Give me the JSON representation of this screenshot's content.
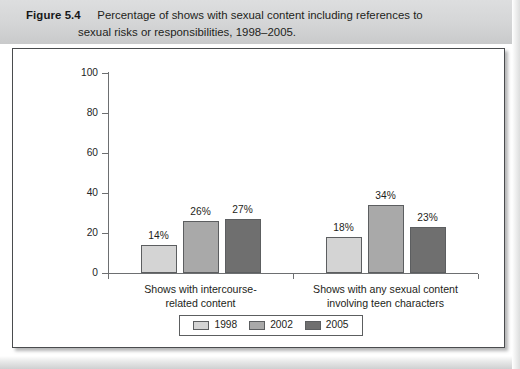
{
  "caption": {
    "figure_label": "Figure 5.4",
    "line1": "Percentage of shows with sexual content including references to",
    "line2": "sexual risks or responsibilities, 1998–2005."
  },
  "chart_data": {
    "type": "bar",
    "title": "Percentage of shows with sexual content including references to sexual risks or responsibilities, 1998–2005.",
    "xlabel": "",
    "ylabel": "",
    "ylim": [
      0,
      100
    ],
    "yticks": [
      "0",
      "20",
      "40",
      "60",
      "80",
      "100"
    ],
    "grid": false,
    "legend_position": "bottom",
    "categories": [
      "Shows with intercourse-related content",
      "Shows with any sexual content involving teen characters"
    ],
    "category_lines": [
      [
        "Shows with intercourse-",
        "related content"
      ],
      [
        "Shows with any sexual content",
        "involving teen characters"
      ]
    ],
    "series": [
      {
        "name": "1998",
        "color": "#d4d4d4",
        "values": [
          14,
          18
        ],
        "labels": [
          "14%",
          "18%"
        ]
      },
      {
        "name": "2002",
        "color": "#a9a9a9",
        "values": [
          26,
          34
        ],
        "labels": [
          "26%",
          "34%"
        ]
      },
      {
        "name": "2005",
        "color": "#6f6f6f",
        "values": [
          27,
          23
        ],
        "labels": [
          "27%",
          "23%"
        ]
      }
    ]
  },
  "legend": {
    "items": [
      {
        "label": "1998",
        "color": "#d4d4d4"
      },
      {
        "label": "2002",
        "color": "#a9a9a9"
      },
      {
        "label": "2005",
        "color": "#6f6f6f"
      }
    ]
  }
}
